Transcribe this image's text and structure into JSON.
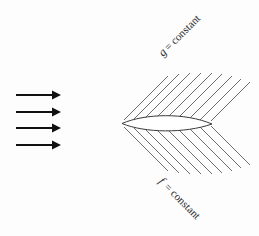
{
  "figure": {
    "title": "",
    "background_color": "#fdfdfd",
    "width": 259,
    "height": 236,
    "labels": {
      "upper": {
        "full_text": "g = constant",
        "variable": "g",
        "relation": "=",
        "value": "constant",
        "rotation_deg": -45,
        "x": 163,
        "y": 57,
        "color": "#2b2b2b"
      },
      "lower": {
        "full_text": "f = constant",
        "variable": "f",
        "relation": "=",
        "value": "constant",
        "rotation_deg": 45,
        "x": 158,
        "y": 182,
        "color": "#2b2b2b"
      }
    },
    "flow_arrows": {
      "name": "freestream-flow-arrows",
      "count": 4,
      "direction": "right",
      "color": "#111111",
      "x_start": 16,
      "x_end": 60,
      "y_positions": [
        95,
        112,
        128,
        145
      ]
    },
    "body": {
      "name": "airfoil-lens-body",
      "shape": "lens",
      "leading_edge_x": 122,
      "leading_edge_y": 123,
      "trailing_edge_x": 212,
      "trailing_edge_y": 124,
      "max_thickness": 9,
      "outline_color": "#3a3a3a",
      "fill_color": "#ffffff"
    },
    "grid": {
      "upper_set": {
        "name": "g-constant-lines",
        "count": 9,
        "angle_deg": -45,
        "color": "#6e6e6e"
      },
      "lower_set": {
        "name": "f-constant-lines",
        "count": 9,
        "angle_deg": 45,
        "color": "#6e6e6e"
      }
    }
  }
}
